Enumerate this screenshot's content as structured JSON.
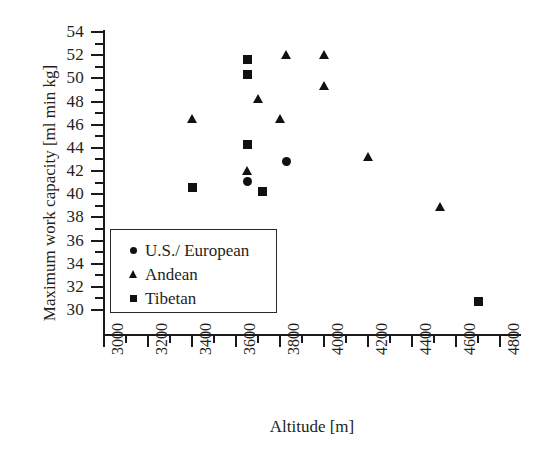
{
  "chart_data": {
    "type": "scatter",
    "title": "",
    "xlabel": "Altitude [m]",
    "ylabel": "Maximum work capacity [ml min kg]",
    "xlim": [
      3000,
      4900
    ],
    "ylim": [
      29,
      54
    ],
    "grid": false,
    "legend_position": "inner-lower-left",
    "x_ticks": [
      3000,
      3200,
      3400,
      3600,
      3800,
      4000,
      4200,
      4400,
      4600,
      4800
    ],
    "x_minor_ticks": [
      3100,
      3300,
      3500,
      3700,
      3900,
      4100,
      4300,
      4500,
      4700
    ],
    "y_ticks": [
      30,
      32,
      34,
      36,
      38,
      40,
      42,
      44,
      46,
      48,
      50,
      52,
      54
    ],
    "y_minor_ticks": [
      31,
      33,
      35,
      37,
      39,
      41,
      43,
      45,
      47,
      49,
      51,
      53
    ],
    "series": [
      {
        "name": "U.S./ European",
        "marker": "circle",
        "color": "#111111",
        "points": [
          {
            "x": 3650,
            "y": 41.1
          },
          {
            "x": 3720,
            "y": 40.2
          },
          {
            "x": 3830,
            "y": 42.8
          }
        ]
      },
      {
        "name": "Andean",
        "marker": "triangle",
        "color": "#111111",
        "points": [
          {
            "x": 3400,
            "y": 46.5
          },
          {
            "x": 3650,
            "y": 42.0
          },
          {
            "x": 3700,
            "y": 48.2
          },
          {
            "x": 3800,
            "y": 46.5
          },
          {
            "x": 3830,
            "y": 52.0
          },
          {
            "x": 4000,
            "y": 52.0
          },
          {
            "x": 4000,
            "y": 49.3
          },
          {
            "x": 4200,
            "y": 43.2
          },
          {
            "x": 4530,
            "y": 38.9
          }
        ]
      },
      {
        "name": "Tibetan",
        "marker": "square",
        "color": "#111111",
        "points": [
          {
            "x": 3400,
            "y": 40.6
          },
          {
            "x": 3650,
            "y": 51.6
          },
          {
            "x": 3650,
            "y": 50.3
          },
          {
            "x": 3650,
            "y": 44.3
          },
          {
            "x": 3720,
            "y": 40.2
          },
          {
            "x": 4700,
            "y": 30.7
          }
        ]
      }
    ]
  },
  "legend": {
    "items": [
      {
        "label": "U.S./ European",
        "marker": "circle"
      },
      {
        "label": "Andean",
        "marker": "triangle"
      },
      {
        "label": "Tibetan",
        "marker": "square"
      }
    ]
  }
}
